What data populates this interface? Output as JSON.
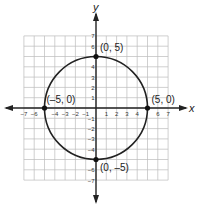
{
  "chart_data": {
    "type": "scatter",
    "title": "",
    "xlabel": "x",
    "ylabel": "y",
    "xlim": [
      -7,
      7
    ],
    "ylim": [
      -7,
      7
    ],
    "grid": true,
    "x_ticks": [
      "-7",
      "-6",
      "-4",
      "-3",
      "-2",
      "-1",
      "1",
      "2",
      "3",
      "4",
      "6",
      "7"
    ],
    "y_ticks": [
      "7",
      "6",
      "4",
      "3",
      "2",
      "1",
      "-1",
      "-2",
      "-3",
      "-4",
      "-6",
      "-7"
    ],
    "circle": {
      "center": [
        0,
        0
      ],
      "radius": 5
    },
    "points": [
      {
        "x": 0,
        "y": 5,
        "label": "(0, 5)"
      },
      {
        "x": -5,
        "y": 0,
        "label": "(–5, 0)"
      },
      {
        "x": 5,
        "y": 0,
        "label": "(5, 0)"
      },
      {
        "x": 0,
        "y": -5,
        "label": "(0, –5)"
      }
    ]
  }
}
